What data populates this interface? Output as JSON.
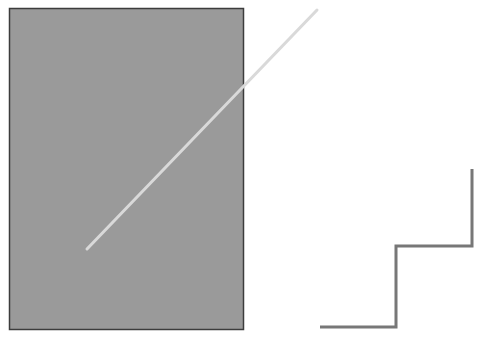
{
  "canvas": {
    "width": 486,
    "height": 338,
    "background": "#ffffff"
  },
  "shapes": {
    "rectangle": {
      "x": 9,
      "y": 8,
      "width": 234,
      "height": 321,
      "fill": "#9a9a9a",
      "stroke": "#3c3c3c"
    },
    "diagonal_line": {
      "x1": 87,
      "y1": 249,
      "x2": 317,
      "y2": 10,
      "stroke": "#d9d9d9"
    },
    "step_line": {
      "points": "320,327 396,327 396,246 472,246 472,169",
      "stroke": "#777777"
    }
  }
}
